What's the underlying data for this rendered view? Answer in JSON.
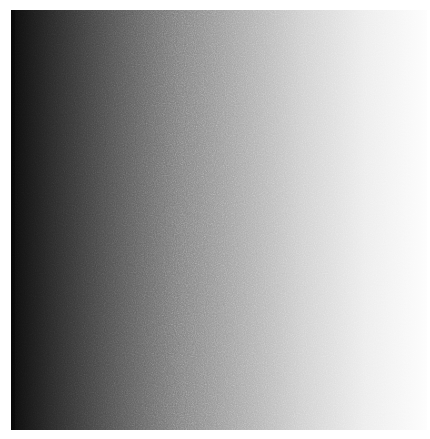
{
  "image": {
    "description": "Noisy horizontal grayscale gradient from black (left) to white (right)",
    "gradient_stops": [
      "#0c0c0c",
      "#555555",
      "#a8a8a8",
      "#ececec",
      "#fdfdfd"
    ],
    "direction": "left-to-right"
  }
}
